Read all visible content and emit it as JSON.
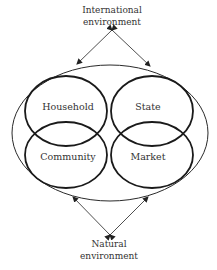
{
  "diagram": {
    "top_label": {
      "line1": "International",
      "line2": "environment"
    },
    "bottom_label": {
      "line1": "Natural",
      "line2": "environment"
    },
    "spheres": [
      {
        "name": "Household"
      },
      {
        "name": "State"
      },
      {
        "name": "Community"
      },
      {
        "name": "Market"
      }
    ],
    "colors": {
      "stroke": "#1a1a1a",
      "outer_stroke": "#2a2a2a",
      "text": "#333333",
      "background": "#ffffff"
    }
  }
}
